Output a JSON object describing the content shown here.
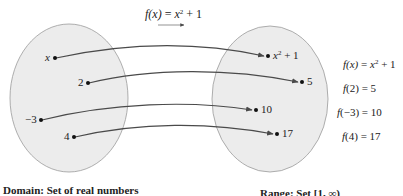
{
  "title": {
    "func": "f",
    "arg": "(x)",
    "eq": " = ",
    "base": "x",
    "exp": "2",
    "tail": " + 1"
  },
  "domain": {
    "label": "Domain: Set of real numbers",
    "points": [
      {
        "label": "x",
        "italic": true
      },
      {
        "label": "2"
      },
      {
        "label": "−3"
      },
      {
        "label": "4"
      }
    ]
  },
  "range": {
    "label": "Range: Set [1, ∞)",
    "points": [
      {
        "base": "x",
        "exp": "2",
        "tail": " + 1"
      },
      {
        "label": "5"
      },
      {
        "label": "10"
      },
      {
        "label": "17"
      }
    ]
  },
  "equations": [
    {
      "lhs_f": "f",
      "lhs_arg": "(x)",
      "eq": " = ",
      "base": "x",
      "exp": "2",
      "tail": " + 1"
    },
    {
      "lhs_f": "f",
      "lhs_arg": "(2)",
      "eq": " = ",
      "rhs": "5"
    },
    {
      "lhs_f": "f",
      "lhs_arg": "(−3)",
      "eq": " = ",
      "rhs": "10"
    },
    {
      "lhs_f": "f",
      "lhs_arg": "(4)",
      "eq": " = ",
      "rhs": "17"
    }
  ],
  "colors": {
    "ellipse_fill": "#ececec",
    "ellipse_stroke": "#9a9a9a",
    "arrow": "#4a4a4a"
  }
}
